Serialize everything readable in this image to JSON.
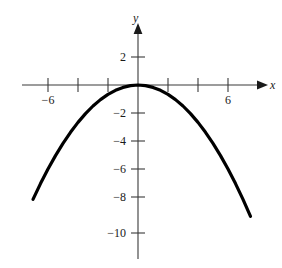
{
  "figure": {
    "name": "parabola-graph",
    "background_color": "#ffffff",
    "axis_color": "#3a3a3a",
    "curve_color": "#000000"
  },
  "axes": {
    "x_axis_label": "x",
    "y_axis_label": "y",
    "x_axis_name": "x-axis",
    "y_axis_name": "y-axis"
  },
  "chart_data": {
    "type": "line",
    "title": "",
    "subtitle": "",
    "xlabel": "x",
    "ylabel": "y",
    "xlim": [
      -7.5,
      8.0
    ],
    "ylim": [
      -11.5,
      3.0
    ],
    "grid": false,
    "legend": null,
    "annotations": [],
    "x_ticks": [
      -6,
      -4,
      -2,
      2,
      4,
      6
    ],
    "x_tick_labels": [
      "−6",
      "",
      "",
      "",
      "",
      "6"
    ],
    "y_ticks": [
      2,
      -2,
      -4,
      -6,
      -8,
      -10
    ],
    "y_tick_labels": [
      "2",
      "−2",
      "−4",
      "−6",
      "−8",
      "−10"
    ],
    "series": [
      {
        "name": "parabola",
        "equation": "y = -x^2/6",
        "x": [
          -7.0,
          -6.5,
          -6.0,
          -5.5,
          -5.0,
          -4.5,
          -4.0,
          -3.5,
          -3.0,
          -2.5,
          -2.0,
          -1.5,
          -1.0,
          -0.5,
          0.0,
          0.5,
          1.0,
          1.5,
          2.0,
          2.5,
          3.0,
          3.5,
          4.0,
          4.5,
          5.0,
          5.5,
          6.0,
          6.5,
          7.0,
          7.5
        ],
        "y": [
          -8.17,
          -7.04,
          -6.0,
          -5.04,
          -4.17,
          -3.38,
          -2.67,
          -2.04,
          -1.5,
          -1.04,
          -0.67,
          -0.38,
          -0.17,
          -0.04,
          0.0,
          -0.04,
          -0.17,
          -0.38,
          -0.67,
          -1.04,
          -1.5,
          -2.04,
          -2.67,
          -3.38,
          -4.17,
          -5.04,
          -6.0,
          -7.04,
          -8.17,
          -9.38
        ]
      }
    ]
  },
  "x_tick_text": {
    "left_six": "−6",
    "right_six": "6"
  },
  "y_tick_text": {
    "positive_two": "2",
    "negative_two": "−2",
    "negative_four": "−4",
    "negative_six": "−6",
    "negative_eight": "−8",
    "negative_ten": "−10"
  }
}
